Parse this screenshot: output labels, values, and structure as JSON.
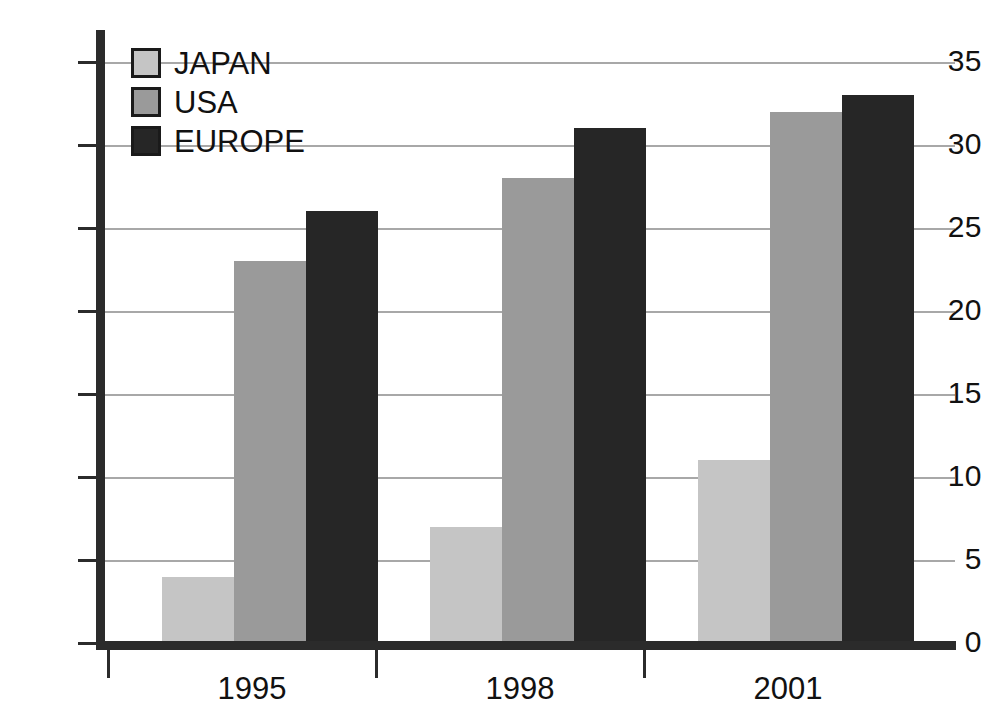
{
  "chart_data": {
    "type": "bar",
    "title": "",
    "subtitle": "",
    "xlabel": "",
    "ylabel": "",
    "categories": [
      "1995",
      "1998",
      "2001"
    ],
    "series": [
      {
        "name": "JAPAN",
        "values": [
          4,
          7,
          11
        ],
        "color": "#c5c5c5"
      },
      {
        "name": "USA",
        "values": [
          23,
          28,
          32
        ],
        "color": "#9a9a9a"
      },
      {
        "name": "EUROPE",
        "values": [
          26,
          31,
          33
        ],
        "color": "#262626"
      }
    ],
    "ylim": [
      0,
      35
    ],
    "yticks": [
      0,
      5,
      10,
      15,
      20,
      25,
      30,
      35
    ],
    "ytick_labels": [
      "0",
      "5",
      "10",
      "15",
      "20",
      "25",
      "30",
      "35"
    ],
    "grid": true,
    "grid_axis": "y",
    "grid_color": "#a8a8a8",
    "legend_position": "top-left",
    "axis_color": "#2b2b2b",
    "background": "#ffffff",
    "annotations": []
  },
  "legend": {
    "items": [
      {
        "label": "JAPAN",
        "color": "#c5c5c5"
      },
      {
        "label": "USA",
        "color": "#9a9a9a"
      },
      {
        "label": "EUROPE",
        "color": "#262626"
      }
    ]
  },
  "axes": {
    "y": {
      "ticks": [
        "35",
        "30",
        "25",
        "20",
        "15",
        "10",
        "5",
        "0"
      ]
    },
    "x": {
      "ticks": [
        "1995",
        "1998",
        "2001"
      ]
    }
  }
}
